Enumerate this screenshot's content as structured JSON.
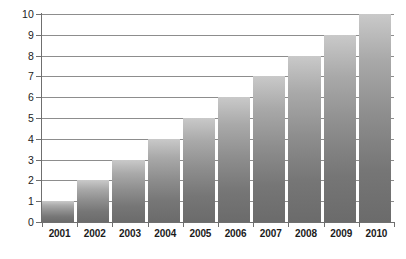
{
  "chart_data": {
    "type": "bar",
    "title": "",
    "subtitle": "",
    "xlabel": "",
    "ylabel": "",
    "categories": [
      "2001",
      "2002",
      "2003",
      "2004",
      "2005",
      "2006",
      "2007",
      "2008",
      "2009",
      "2010"
    ],
    "values": [
      1,
      2,
      3,
      4,
      5,
      6,
      7,
      8,
      9,
      10
    ],
    "series": [
      {
        "name": "",
        "values": [
          1,
          2,
          3,
          4,
          5,
          6,
          7,
          8,
          9,
          10
        ]
      }
    ],
    "ylim": [
      0,
      10
    ],
    "y_ticks": [
      0,
      1,
      2,
      3,
      4,
      5,
      6,
      7,
      8,
      9,
      10
    ],
    "y_tick_labels": [
      "0",
      "1",
      "2",
      "3",
      "4",
      "5",
      "6",
      "7",
      "8",
      "9",
      "10"
    ],
    "grid": true,
    "grid_axis": "y",
    "legend": false,
    "legend_position": "none",
    "annotations": [],
    "colors": {
      "bar_top": "#c9c9c9",
      "bar_bottom": "#6b6b6b",
      "gridline": "#8d8d8d",
      "axis": "#6f6f6f",
      "text": "#1b1b1b",
      "background": "#ffffff"
    }
  }
}
